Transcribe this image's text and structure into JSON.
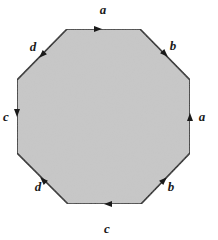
{
  "diagram": {
    "title": "",
    "fill_color": "#c8c8c8",
    "stroke_color": "#1a1a1a",
    "vertices": [
      [
        67,
        29
      ],
      [
        140,
        29
      ],
      [
        190,
        80
      ],
      [
        190,
        153
      ],
      [
        141,
        204
      ],
      [
        68,
        204
      ],
      [
        17,
        153
      ],
      [
        17,
        80
      ]
    ],
    "edges": [
      {
        "id": "top",
        "label": "a",
        "direction": "right",
        "label_pos": [
          103,
          14
        ],
        "arrow": [
          98,
          29,
          0
        ]
      },
      {
        "id": "upper-right",
        "label": "b",
        "direction": "down-right",
        "label_pos": [
          173,
          50
        ],
        "arrow": [
          165,
          54,
          45
        ]
      },
      {
        "id": "right",
        "label": "a",
        "direction": "up",
        "label_pos": [
          202,
          121
        ],
        "arrow": [
          190,
          117,
          -90
        ]
      },
      {
        "id": "lower-right",
        "label": "b",
        "direction": "up-right",
        "label_pos": [
          171,
          191
        ],
        "arrow": [
          164,
          180,
          -45
        ]
      },
      {
        "id": "bottom",
        "label": "c",
        "direction": "left",
        "label_pos": [
          107,
          233
        ],
        "arrow": [
          108,
          204,
          180
        ]
      },
      {
        "id": "lower-left",
        "label": "d",
        "direction": "up-left",
        "label_pos": [
          38,
          191
        ],
        "arrow": [
          43,
          180,
          -135
        ]
      },
      {
        "id": "left",
        "label": "c",
        "direction": "down",
        "label_pos": [
          6,
          121
        ],
        "arrow": [
          17,
          113,
          90
        ]
      },
      {
        "id": "upper-left",
        "label": "d",
        "direction": "down-left",
        "label_pos": [
          33,
          51
        ],
        "arrow": [
          42,
          55,
          135
        ]
      }
    ]
  }
}
